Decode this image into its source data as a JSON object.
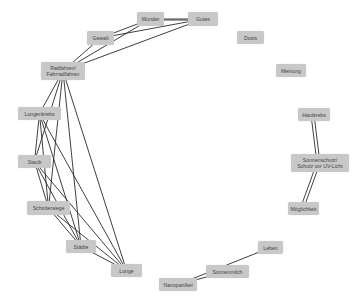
{
  "graph": {
    "nodes": [
      {
        "id": "wunder",
        "label": "Wunder",
        "x": 137,
        "y": 12,
        "w": 27,
        "h": 14
      },
      {
        "id": "gutes",
        "label": "Gutes",
        "x": 188,
        "y": 12,
        "w": 30,
        "h": 14
      },
      {
        "id": "gewalt",
        "label": "Gewalt",
        "x": 87,
        "y": 31,
        "w": 27,
        "h": 14
      },
      {
        "id": "dosis",
        "label": "Dosis",
        "x": 237,
        "y": 31,
        "w": 27,
        "h": 13
      },
      {
        "id": "radfahren",
        "label": "Radfahren/\nFahrradfahren",
        "x": 41,
        "y": 62,
        "w": 44,
        "h": 18
      },
      {
        "id": "meinung",
        "label": "Meinung",
        "x": 276,
        "y": 64,
        "w": 30,
        "h": 13
      },
      {
        "id": "lungenkrebs",
        "label": "Lungenkrebs",
        "x": 18,
        "y": 107,
        "w": 43,
        "h": 13
      },
      {
        "id": "hautkrebs",
        "label": "Hautkrebs",
        "x": 298,
        "y": 108,
        "w": 32,
        "h": 13
      },
      {
        "id": "staub",
        "label": "Staub",
        "x": 18,
        "y": 155,
        "w": 33,
        "h": 13
      },
      {
        "id": "sonnenschutz",
        "label": "Sonnenschutz/\nSchutz vor UV-Licht",
        "x": 291,
        "y": 154,
        "w": 58,
        "h": 18
      },
      {
        "id": "schotterwege",
        "label": "Schotterwege",
        "x": 27,
        "y": 201,
        "w": 43,
        "h": 14
      },
      {
        "id": "moeglichkeit",
        "label": "Möglichkeit",
        "x": 288,
        "y": 202,
        "w": 31,
        "h": 13
      },
      {
        "id": "staedte",
        "label": "Städte",
        "x": 66,
        "y": 240,
        "w": 30,
        "h": 13
      },
      {
        "id": "leben",
        "label": "Leben",
        "x": 258,
        "y": 241,
        "w": 25,
        "h": 13
      },
      {
        "id": "lunge",
        "label": "Lunge",
        "x": 111,
        "y": 264,
        "w": 31,
        "h": 13
      },
      {
        "id": "sonnenmilch",
        "label": "Sonnenmilch",
        "x": 206,
        "y": 265,
        "w": 43,
        "h": 13
      },
      {
        "id": "nanopartikel",
        "label": "Nanopartikel",
        "x": 159,
        "y": 278,
        "w": 38,
        "h": 13
      }
    ],
    "edges": [
      {
        "from": "wunder",
        "to": "gutes"
      },
      {
        "from": "wunder",
        "to": "gutes",
        "offset": 2
      },
      {
        "from": "gewalt",
        "to": "wunder"
      },
      {
        "from": "gewalt",
        "to": "gutes"
      },
      {
        "from": "radfahren",
        "to": "wunder"
      },
      {
        "from": "radfahren",
        "to": "gutes"
      },
      {
        "from": "radfahren",
        "to": "gewalt"
      },
      {
        "from": "radfahren",
        "to": "lungenkrebs"
      },
      {
        "from": "radfahren",
        "to": "staub"
      },
      {
        "from": "radfahren",
        "to": "schotterwege"
      },
      {
        "from": "radfahren",
        "to": "staedte"
      },
      {
        "from": "radfahren",
        "to": "lunge"
      },
      {
        "from": "lungenkrebs",
        "to": "staub"
      },
      {
        "from": "lungenkrebs",
        "to": "schotterwege"
      },
      {
        "from": "lungenkrebs",
        "to": "staedte"
      },
      {
        "from": "lungenkrebs",
        "to": "lunge"
      },
      {
        "from": "staub",
        "to": "schotterwege"
      },
      {
        "from": "staub",
        "to": "staedte"
      },
      {
        "from": "staub",
        "to": "lunge"
      },
      {
        "from": "schotterwege",
        "to": "staedte"
      },
      {
        "from": "schotterwege",
        "to": "lunge"
      },
      {
        "from": "staedte",
        "to": "lunge"
      },
      {
        "from": "hautkrebs",
        "to": "sonnenschutz"
      },
      {
        "from": "hautkrebs",
        "to": "sonnenschutz",
        "offset": 6
      },
      {
        "from": "sonnenschutz",
        "to": "moeglichkeit"
      },
      {
        "from": "sonnenschutz",
        "to": "moeglichkeit",
        "offset": 6
      },
      {
        "from": "leben",
        "to": "nanopartikel"
      },
      {
        "from": "sonnenmilch",
        "to": "nanopartikel"
      }
    ],
    "colors": {
      "node_fill": "#c8c8c8",
      "node_text": "#444444",
      "edge": "#2a2a2a",
      "background": "#ffffff"
    }
  }
}
